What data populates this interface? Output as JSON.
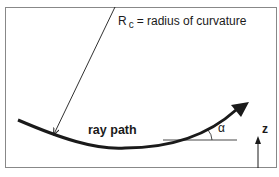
{
  "diagram": {
    "labels": {
      "radius_symbol": "R",
      "radius_subscript": "c",
      "radius_definition": "= radius of curvature",
      "ray_path": "ray path",
      "angle": "α",
      "axis": "z"
    },
    "colors": {
      "stroke": "#1a1a1a",
      "frame": "#888888",
      "background": "#ffffff"
    }
  }
}
